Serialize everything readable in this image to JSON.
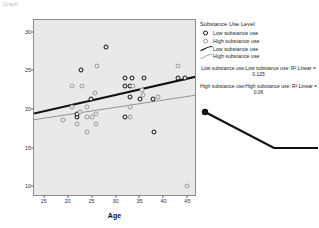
{
  "corner_note": "Graph",
  "chart_data": {
    "type": "scatter",
    "title": "",
    "xlabel": "Age",
    "ylabel": "Self-Esteem Score",
    "xlim": [
      13,
      47
    ],
    "ylim": [
      8.6,
      31.5
    ],
    "xticks": [
      15,
      20,
      25,
      30,
      35,
      40,
      45
    ],
    "yticks": [
      10,
      15,
      20,
      25,
      30
    ],
    "grid": false,
    "legend_position": "right",
    "series": [
      {
        "name": "Low substance use",
        "marker": "bold-open-circle",
        "points": [
          [
            22,
            19
          ],
          [
            22,
            19.4
          ],
          [
            22.8,
            25
          ],
          [
            24.8,
            21.3
          ],
          [
            28,
            28
          ],
          [
            32,
            24
          ],
          [
            32,
            23
          ],
          [
            33,
            23
          ],
          [
            33.4,
            24
          ],
          [
            33,
            21.5
          ],
          [
            35.2,
            21.3
          ],
          [
            36,
            24
          ],
          [
            37.8,
            21.3
          ],
          [
            38,
            17
          ],
          [
            32,
            19
          ],
          [
            43,
            24
          ],
          [
            44.6,
            24
          ]
        ]
      },
      {
        "name": "High substance use",
        "marker": "thin-open-circle",
        "points": [
          [
            19,
            18.6
          ],
          [
            21,
            23
          ],
          [
            21,
            20.2
          ],
          [
            22,
            18
          ],
          [
            22.6,
            19.6
          ],
          [
            23,
            23
          ],
          [
            24,
            19
          ],
          [
            24,
            20.2
          ],
          [
            24,
            17
          ],
          [
            25.8,
            22
          ],
          [
            25,
            19
          ],
          [
            26,
            19.4
          ],
          [
            26,
            18
          ],
          [
            26.2,
            25.6
          ],
          [
            33.6,
            23
          ],
          [
            33,
            19
          ],
          [
            33,
            20.2
          ],
          [
            35.8,
            21.8
          ],
          [
            35.6,
            22.4
          ],
          [
            38.8,
            21.5
          ],
          [
            43,
            25.6
          ],
          [
            45,
            10
          ]
        ]
      }
    ],
    "fit_lines": [
      {
        "name": "Low substance use",
        "style": "thick",
        "x1": 13,
        "y1": 19.4,
        "x2": 47,
        "y2": 24.2
      },
      {
        "name": "High substance use",
        "style": "thin",
        "x1": 13,
        "y1": 18.6,
        "x2": 47,
        "y2": 21.8
      }
    ]
  },
  "legend": {
    "title": "Substance Use Level",
    "items": [
      {
        "label": "Low substance use",
        "key": "low-marker"
      },
      {
        "label": "High substance use",
        "key": "high-marker"
      },
      {
        "label": "Low substance use",
        "key": "low-fit-line"
      },
      {
        "label": "High substance use",
        "key": "high-fit-line"
      }
    ]
  },
  "annotations": [
    {
      "id": "r2-low",
      "text": "Low substance use:Low substance use: R² Linear = 0.125"
    },
    {
      "id": "r2-high",
      "text": "High substance use:High substance use: R² Linear = 0.06"
    }
  ],
  "pointer": {
    "name": "pointer-annotation"
  }
}
